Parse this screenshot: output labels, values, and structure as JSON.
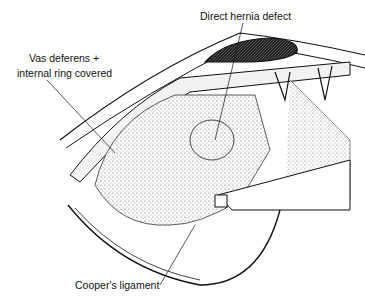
{
  "figure": {
    "type": "surgical illustration",
    "labels": {
      "direct_hernia_defect": "Direct hernia defect",
      "vas_line1": "Vas deferens +",
      "vas_line2": "internal ring covered",
      "coopers_ligament": "Cooper's ligament"
    },
    "colors": {
      "ink": "#111111",
      "background": "#ffffff",
      "stipple": "#c8c8c8"
    }
  }
}
